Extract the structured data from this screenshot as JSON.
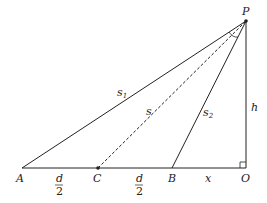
{
  "diagram": {
    "points": {
      "P": {
        "label": "P",
        "x": 246,
        "y": 21
      },
      "A": {
        "label": "A",
        "x": 22,
        "y": 168
      },
      "C": {
        "label": "C",
        "x": 98,
        "y": 168
      },
      "B": {
        "label": "B",
        "x": 172,
        "y": 168
      },
      "O": {
        "label": "O",
        "x": 246,
        "y": 168
      }
    },
    "segments": {
      "s1": {
        "label": "s",
        "sub": "1",
        "from": "A",
        "to": "P",
        "style": "solid"
      },
      "s": {
        "label": "s",
        "from": "C",
        "to": "P",
        "style": "dashed"
      },
      "s2": {
        "label": "s",
        "sub": "2",
        "from": "B",
        "to": "P",
        "style": "solid"
      },
      "h": {
        "label": "h",
        "from": "O",
        "to": "P",
        "style": "solid"
      },
      "base": {
        "from": "A",
        "to": "O",
        "style": "solid"
      }
    },
    "base_labels": {
      "AC": {
        "num": "d",
        "den": "2"
      },
      "CB": {
        "num": "d",
        "den": "2"
      },
      "BO": {
        "label": "x"
      }
    },
    "right_angle_at": "O",
    "angle_mark_at": "P",
    "colors": {
      "line": "#222222",
      "background": "#ffffff"
    }
  }
}
